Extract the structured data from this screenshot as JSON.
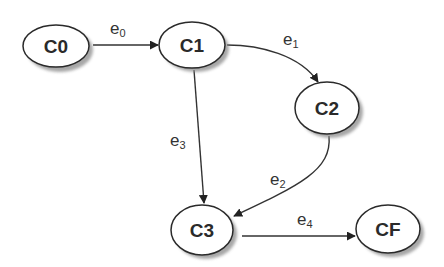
{
  "diagram": {
    "type": "state-transition-graph",
    "nodes": [
      {
        "id": "C0",
        "label": "C0"
      },
      {
        "id": "C1",
        "label": "C1"
      },
      {
        "id": "C2",
        "label": "C2"
      },
      {
        "id": "C3",
        "label": "C3"
      },
      {
        "id": "CF",
        "label": "CF"
      }
    ],
    "edges": [
      {
        "id": "e0",
        "base": "e",
        "sub": "0",
        "from": "C0",
        "to": "C1"
      },
      {
        "id": "e1",
        "base": "e",
        "sub": "1",
        "from": "C1",
        "to": "C2"
      },
      {
        "id": "e2",
        "base": "e",
        "sub": "2",
        "from": "C2",
        "to": "C3"
      },
      {
        "id": "e3",
        "base": "e",
        "sub": "3",
        "from": "C1",
        "to": "C3"
      },
      {
        "id": "e4",
        "base": "e",
        "sub": "4",
        "from": "C3",
        "to": "CF"
      }
    ]
  }
}
